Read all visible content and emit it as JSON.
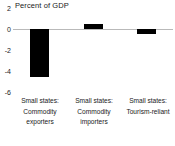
{
  "chart_data": {
    "type": "bar",
    "title": "Percent of GDP",
    "xlabel": "",
    "ylabel": "",
    "ylim": [
      -6,
      2
    ],
    "yticks": [
      2,
      0,
      -2,
      -4,
      -6
    ],
    "ytick_labels": [
      "2",
      "0",
      "-2",
      "-4",
      "-6"
    ],
    "grid": false,
    "legend": null,
    "zero_line": 0,
    "bar_color": "#000000",
    "axis_color": "#b9b9b9",
    "categories": [
      "Small states: Commodity exporters",
      "Small states: Commodity importers",
      "Small states: Tourism-reliant"
    ],
    "category_lines": [
      [
        "Small states:",
        "Commodity",
        "exporters"
      ],
      [
        "Small states:",
        "Commodity",
        "importers"
      ],
      [
        "Small states:",
        "Tourism-reliant"
      ]
    ],
    "values": [
      -4.6,
      0.45,
      -0.5
    ]
  }
}
